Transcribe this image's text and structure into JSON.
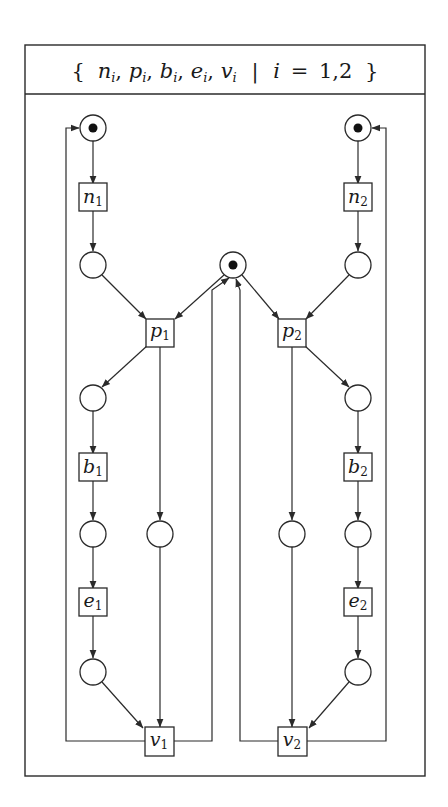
{
  "header": {
    "set_expression": "{ n_i, p_i, b_i, e_i, v_i | i = 1,2 }",
    "parts": {
      "open_brace": "{",
      "close_brace": "}",
      "separator": "|",
      "index_var": "i",
      "equals": "=",
      "range": "1,2",
      "comma": ","
    },
    "elements": [
      {
        "base": "n",
        "sub": "i"
      },
      {
        "base": "p",
        "sub": "i"
      },
      {
        "base": "b",
        "sub": "i"
      },
      {
        "base": "e",
        "sub": "i"
      },
      {
        "base": "v",
        "sub": "i"
      }
    ]
  },
  "colors": {
    "stroke": "#2a2a2a",
    "token": "#111111",
    "background": "#ffffff"
  },
  "transitions": [
    {
      "id": "n1",
      "base": "n",
      "sub": "1"
    },
    {
      "id": "n2",
      "base": "n",
      "sub": "2"
    },
    {
      "id": "p1",
      "base": "p",
      "sub": "1"
    },
    {
      "id": "p2",
      "base": "p",
      "sub": "2"
    },
    {
      "id": "b1",
      "base": "b",
      "sub": "1"
    },
    {
      "id": "b2",
      "base": "b",
      "sub": "2"
    },
    {
      "id": "e1",
      "base": "e",
      "sub": "1"
    },
    {
      "id": "e2",
      "base": "e",
      "sub": "2"
    },
    {
      "id": "v1",
      "base": "v",
      "sub": "1"
    },
    {
      "id": "v2",
      "base": "v",
      "sub": "2"
    }
  ],
  "places": {
    "marked": [
      "top-left",
      "top-right",
      "center-mutex"
    ],
    "unmarked_count": 12
  }
}
